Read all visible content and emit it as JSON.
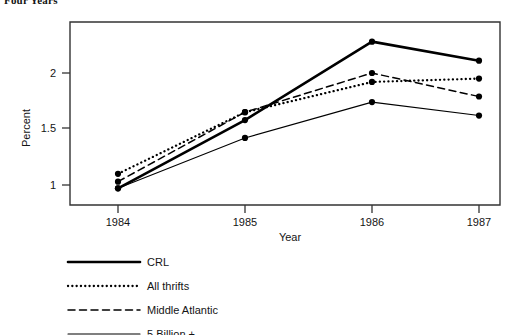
{
  "caption": "Four Years",
  "chart_data": {
    "type": "line",
    "title": "Four Years",
    "xlabel": "Year",
    "ylabel": "Percent",
    "categories": [
      "1984",
      "1985",
      "1986",
      "1987"
    ],
    "x": [
      1984,
      1985,
      1986,
      1987
    ],
    "xlim": [
      1983.6,
      1987.45
    ],
    "ylim": [
      0.83,
      2.45
    ],
    "yticks": [
      "1",
      "1.5",
      "2"
    ],
    "ytick_values": [
      1,
      1.5,
      2
    ],
    "xticks": [
      "1984",
      "1985",
      "1986",
      "1987"
    ],
    "grid": false,
    "legend_position": "below-left",
    "series": [
      {
        "name": "CRL",
        "style": "solid-thick",
        "color": "#000000",
        "values": [
          0.97,
          1.58,
          2.28,
          2.11
        ]
      },
      {
        "name": "All thrifts",
        "style": "dotted",
        "color": "#000000",
        "values": [
          1.1,
          1.65,
          1.92,
          1.95
        ]
      },
      {
        "name": "Middle Atlantic",
        "style": "dashed",
        "color": "#000000",
        "values": [
          1.03,
          1.65,
          2.0,
          1.79
        ]
      },
      {
        "name": "5 Billion +",
        "style": "solid-thin",
        "color": "#000000",
        "values": [
          0.97,
          1.42,
          1.74,
          1.62
        ]
      }
    ]
  },
  "axes": {
    "y_title": "Percent",
    "x_title": "Year",
    "y_tick_labels": [
      "2",
      "1.5",
      "1"
    ],
    "x_tick_labels": [
      "1984",
      "1985",
      "1986",
      "1987"
    ]
  },
  "legend": {
    "items": [
      {
        "label": "CRL",
        "style": "solid-thick"
      },
      {
        "label": "All thrifts",
        "style": "dotted"
      },
      {
        "label": "Middle Atlantic",
        "style": "dashed"
      },
      {
        "label": "5 Billion +",
        "style": "solid-thin"
      }
    ]
  }
}
